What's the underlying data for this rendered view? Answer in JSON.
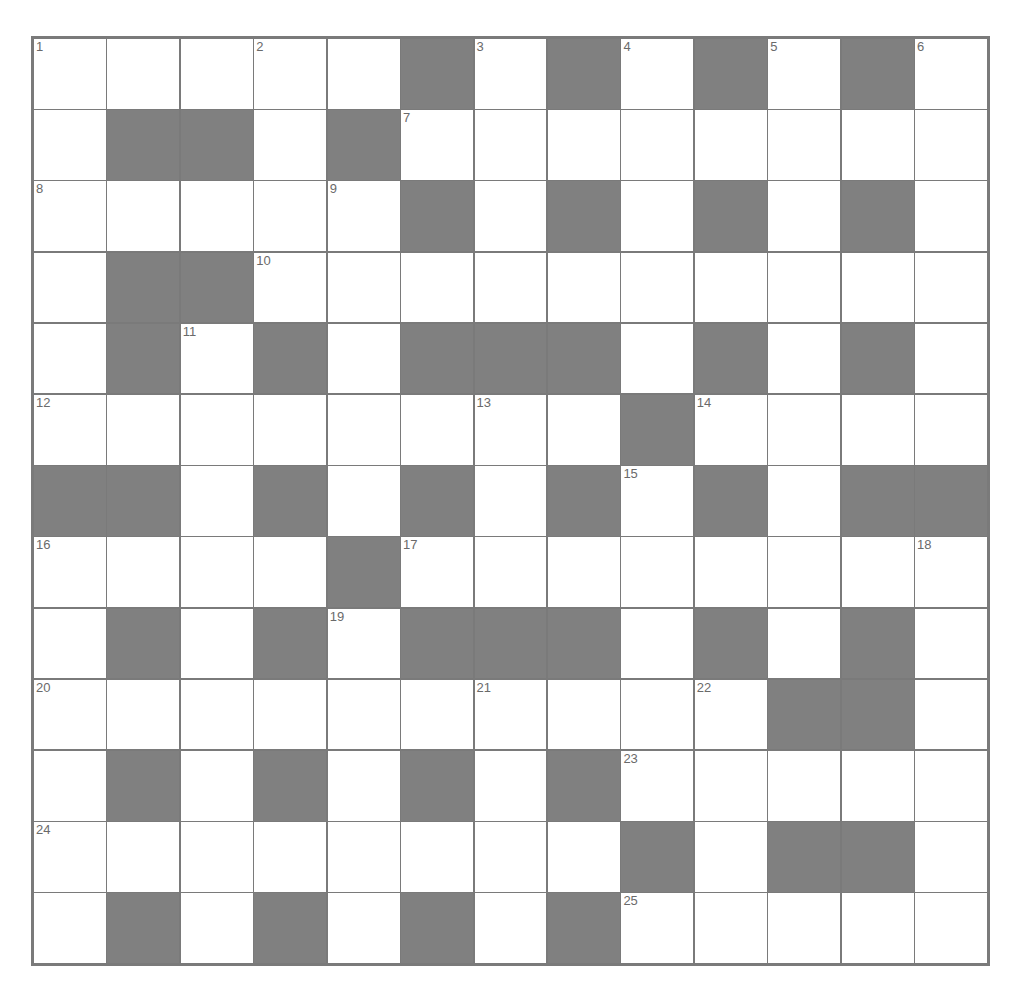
{
  "puzzle": {
    "type": "crossword",
    "rows": 13,
    "cols": 13,
    "colors": {
      "block": "#808080",
      "cell": "#ffffff",
      "line": "#7a7a7a",
      "number": "#6a6a6a"
    },
    "grid": [
      ".....#.#.#.#.",
      ".##.#........",
      ".....#.#.#.#.",
      ".##..........",
      ".#.#.###.#.#.",
      "........#....",
      "##.#.#.#.#.##",
      "....#........",
      ".#.#.###.#.#.",
      "..........##.",
      ".#.#.#.#.....",
      "........#.##.",
      ".#.#.#.#....."
    ],
    "numbers": [
      {
        "n": "1",
        "r": 0,
        "c": 0
      },
      {
        "n": "2",
        "r": 0,
        "c": 3
      },
      {
        "n": "3",
        "r": 0,
        "c": 6
      },
      {
        "n": "4",
        "r": 0,
        "c": 8
      },
      {
        "n": "5",
        "r": 0,
        "c": 10
      },
      {
        "n": "6",
        "r": 0,
        "c": 12
      },
      {
        "n": "7",
        "r": 1,
        "c": 5
      },
      {
        "n": "8",
        "r": 2,
        "c": 0
      },
      {
        "n": "9",
        "r": 2,
        "c": 4
      },
      {
        "n": "10",
        "r": 3,
        "c": 3
      },
      {
        "n": "11",
        "r": 4,
        "c": 2
      },
      {
        "n": "12",
        "r": 5,
        "c": 0
      },
      {
        "n": "13",
        "r": 5,
        "c": 6
      },
      {
        "n": "14",
        "r": 5,
        "c": 9
      },
      {
        "n": "15",
        "r": 6,
        "c": 8
      },
      {
        "n": "16",
        "r": 7,
        "c": 0
      },
      {
        "n": "17",
        "r": 7,
        "c": 5
      },
      {
        "n": "18",
        "r": 7,
        "c": 12
      },
      {
        "n": "19",
        "r": 8,
        "c": 4
      },
      {
        "n": "20",
        "r": 9,
        "c": 0
      },
      {
        "n": "21",
        "r": 9,
        "c": 6
      },
      {
        "n": "22",
        "r": 9,
        "c": 9
      },
      {
        "n": "23",
        "r": 10,
        "c": 8
      },
      {
        "n": "24",
        "r": 11,
        "c": 0
      },
      {
        "n": "25",
        "r": 12,
        "c": 8
      }
    ]
  }
}
